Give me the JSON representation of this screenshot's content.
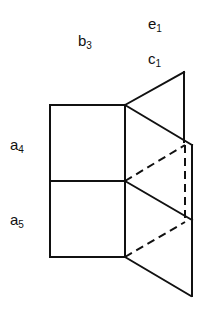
{
  "labels": {
    "e": {
      "base": "e",
      "sub": "1"
    },
    "b": {
      "base": "b",
      "sub": "3"
    },
    "c": {
      "base": "c",
      "sub": "1"
    },
    "a4": {
      "base": "a",
      "sub": "4"
    },
    "a5": {
      "base": "a",
      "sub": "5"
    }
  },
  "colors": {
    "stroke": "#111111",
    "background": "#ffffff"
  }
}
